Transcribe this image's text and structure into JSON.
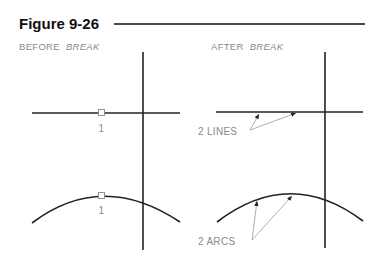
{
  "figure": {
    "title": "Figure 9-26",
    "rule_color": "#111111"
  },
  "panels": [
    {
      "id": "before",
      "caption_prefix": "BEFORE",
      "caption_command": "BREAK",
      "line_pick_label": "1",
      "arc_pick_label": "1"
    },
    {
      "id": "after",
      "caption_prefix": "AFTER",
      "caption_command": "BREAK",
      "lines_label": "2  LINES",
      "arcs_label": "2  ARCS"
    }
  ],
  "colors": {
    "geometry": "#222222",
    "annotation": "#8a8a8a"
  }
}
